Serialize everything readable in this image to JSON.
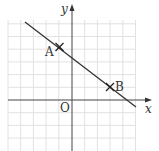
{
  "diagram": {
    "type": "coordinate-plane",
    "axes": {
      "x_label": "x",
      "y_label": "y",
      "origin_label": "O"
    },
    "grid": {
      "x_range": [
        -5,
        5
      ],
      "y_range": [
        -4,
        6
      ],
      "spacing_px": 12.7
    },
    "points": [
      {
        "label": "A",
        "x": -1,
        "y": 4
      },
      {
        "label": "B",
        "x": 3,
        "y": 1
      }
    ],
    "line": {
      "through": [
        "A",
        "B"
      ],
      "slope": -0.75
    },
    "colors": {
      "grid": "#e4e4e4",
      "axis": "#333333",
      "line": "#333333"
    }
  }
}
